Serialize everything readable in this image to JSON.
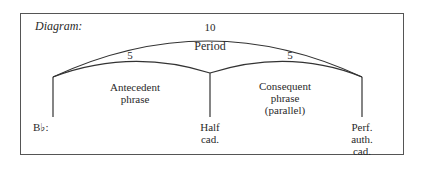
{
  "diagram": {
    "title": "Diagram:",
    "period": {
      "count": "10",
      "label": "Period"
    },
    "antecedent": {
      "count": "5",
      "label": "Antecedent\nphrase"
    },
    "consequent": {
      "count": "5",
      "label": "Consequent\nphrase\n(parallel)"
    },
    "key": "B♭:",
    "cadences": {
      "half": "Half\ncad.",
      "perfect": "Perf.\nauth.\ncad."
    },
    "colors": {
      "line": "#333333",
      "text": "#2a2a2a",
      "frame": "#555555"
    }
  }
}
